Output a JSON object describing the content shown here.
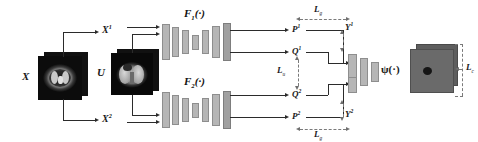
{
  "figure": {
    "type": "neural-network-architecture-diagram",
    "domain": "medical-imaging"
  },
  "inputs": {
    "x_label": "X",
    "u_label": "U",
    "x1_label": "X",
    "x1_sup": "1",
    "x2_label": "X",
    "x2_sup": "2"
  },
  "networks": {
    "f1": {
      "name": "F",
      "sub": "1",
      "args": "(·)"
    },
    "f2": {
      "name": "F",
      "sub": "2",
      "args": "(·)"
    },
    "psi": {
      "name": "ψ",
      "args": "(·)"
    }
  },
  "features": {
    "p1": {
      "name": "P",
      "sup": "1"
    },
    "q1": {
      "name": "Q",
      "sup": "1"
    },
    "q2": {
      "name": "Q",
      "sup": "2"
    },
    "p2": {
      "name": "P",
      "sup": "2"
    }
  },
  "outputs": {
    "y1": {
      "name": "Y",
      "sup": "1"
    },
    "y2": {
      "name": "Y",
      "sup": "2"
    }
  },
  "losses": {
    "lg_top": {
      "name": "L",
      "sub": "g"
    },
    "lu": {
      "name": "L",
      "sub": "u"
    },
    "lg_bottom": {
      "name": "L",
      "sub": "g"
    },
    "lc": {
      "name": "L",
      "sub": "c"
    }
  },
  "colors": {
    "block_fill": "#b6b6b6",
    "block_stroke": "#8e8e8e",
    "line": "#2b2b2b",
    "dashed_line": "#7a7a7a",
    "output_image": "#6a6a6a",
    "background": "#ffffff"
  },
  "encoder_bars": {
    "heights": [
      34,
      28,
      22,
      13,
      22,
      30,
      36
    ],
    "widths": [
      6,
      5,
      5,
      5,
      5,
      6,
      6
    ]
  }
}
